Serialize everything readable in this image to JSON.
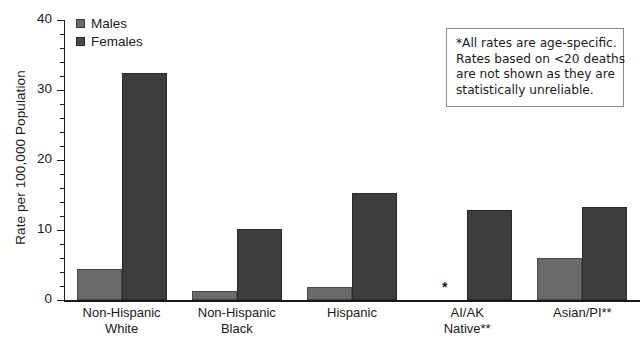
{
  "chart_data": {
    "type": "bar",
    "title": "",
    "xlabel": "",
    "ylabel": "Rate per 100,000 Population",
    "ylim": [
      0,
      40
    ],
    "yticks": [
      0,
      10,
      20,
      30,
      40
    ],
    "ytick_labels": [
      "0",
      "10",
      "20",
      "30",
      "40"
    ],
    "minor_tick_step": 2,
    "grid": false,
    "legend_position": "top-left",
    "categories": [
      {
        "line1": "Non-Hispanic",
        "line2": "White"
      },
      {
        "line1": "Non-Hispanic",
        "line2": "Black"
      },
      {
        "line1": "Hispanic",
        "line2": ""
      },
      {
        "line1": "AI/AK",
        "line2": "Native**"
      },
      {
        "line1": "Asian/PI**",
        "line2": ""
      }
    ],
    "series": [
      {
        "name": "Males",
        "color": "#6a6a6a",
        "values": [
          4.4,
          1.3,
          1.8,
          null,
          6.0
        ],
        "suppressed_marker": "*"
      },
      {
        "name": "Females",
        "color": "#3d3d3d",
        "values": [
          32.4,
          10.1,
          15.3,
          12.9,
          13.3
        ]
      }
    ]
  },
  "legend": {
    "items": [
      {
        "label": "Males",
        "swatch": "legend-swatch-males"
      },
      {
        "label": "Females",
        "swatch": "legend-swatch-females"
      }
    ]
  },
  "note": {
    "lines": [
      "*All rates are age-specific.",
      "Rates based on <20 deaths",
      "are not shown as they are",
      "statistically unreliable."
    ]
  },
  "axis": {
    "y_title": "Rate per 100,000 Population"
  }
}
